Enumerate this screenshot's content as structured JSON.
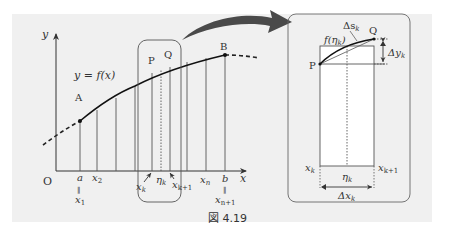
{
  "figure": {
    "caption_label": "図 4.19",
    "colors": {
      "panel_background": "#f0f0f0",
      "line": "#333333",
      "arrow": "#4a4a4a",
      "inset_fill": "#ffffff"
    }
  },
  "main_graph": {
    "axis_x_label": "x",
    "axis_y_label": "y",
    "origin_label": "O",
    "curve_label": "y = f(x)",
    "point_a_label": "A",
    "point_b_label": "B",
    "point_p_label": "P",
    "point_q_label": "Q",
    "tick_labels": {
      "a": "a",
      "x1": "x",
      "x1_sub": "1",
      "x2": "x",
      "x2_sub": "2",
      "xk": "x",
      "xk_sub": "k",
      "eta_k": "η",
      "eta_k_sub": "k",
      "xk1": "x",
      "xk1_sub": "k+1",
      "xn": "x",
      "xn_sub": "n",
      "b": "b",
      "xn1": "x",
      "xn1_sub": "n+1",
      "equals_sign": "‖"
    }
  },
  "inset": {
    "point_p_label": "P",
    "point_q_label": "Q",
    "f_eta_label": "f(η",
    "f_eta_sub": "k",
    "f_eta_close": ")",
    "delta_s_label": "Δs",
    "delta_s_sub": "k",
    "delta_y_label": "Δy",
    "delta_y_sub": "k",
    "delta_x_label": "Δx",
    "delta_x_sub": "k",
    "xk_label": "x",
    "xk_sub": "k",
    "xk1_label": "x",
    "xk1_sub": "k+1",
    "eta_label": "η",
    "eta_sub": "k"
  }
}
